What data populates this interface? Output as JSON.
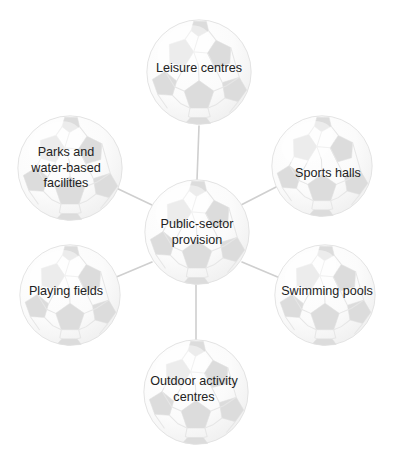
{
  "diagram": {
    "type": "hub-and-spoke",
    "shape_motif": "football",
    "colors": {
      "background": "#ffffff",
      "ball_base": "#fbfbfb",
      "ball_patch": "#dcdcdc",
      "ball_seam": "#e4e4e4",
      "ball_outline": "#e0e0e0",
      "connector": "#cfcfcf",
      "text": "#222222"
    },
    "center": {
      "id": "public-sector-provision",
      "label": "Public-sector provision",
      "lines": [
        "Public-sector",
        "provision"
      ],
      "cx": 197,
      "cy": 232,
      "r": 53
    },
    "nodes": [
      {
        "id": "leisure-centres",
        "label": "Leisure centres",
        "lines": [
          "Leisure centres"
        ],
        "cx": 199,
        "cy": 72,
        "r": 53,
        "label_x": 199,
        "label_y": 69
      },
      {
        "id": "sports-halls",
        "label": "Sports halls",
        "lines": [
          "Sports halls"
        ],
        "cx": 322,
        "cy": 166,
        "r": 51,
        "label_x": 328,
        "label_y": 174
      },
      {
        "id": "swimming-pools",
        "label": "Swimming pools",
        "lines": [
          "Swimming pools"
        ],
        "cx": 325,
        "cy": 295,
        "r": 51,
        "label_x": 327,
        "label_y": 292
      },
      {
        "id": "outdoor-activity-centres",
        "label": "Outdoor activity centres",
        "lines": [
          "Outdoor activity",
          "centres"
        ],
        "cx": 196,
        "cy": 392,
        "r": 53,
        "label_x": 194,
        "label_y": 389
      },
      {
        "id": "playing-fields",
        "label": "Playing fields",
        "lines": [
          "Playing fields"
        ],
        "cx": 70,
        "cy": 295,
        "r": 51,
        "label_x": 66,
        "label_y": 292
      },
      {
        "id": "parks-and-water-based-facilities",
        "label": "Parks and water-based facilities",
        "lines": [
          "Parks and",
          "water-based",
          "facilities"
        ],
        "cx": 70,
        "cy": 168,
        "r": 53,
        "label_x": 66,
        "label_y": 168
      }
    ],
    "connectors": [
      {
        "id": "center-to-leisure-centres",
        "from": "public-sector-provision",
        "to": "leisure-centres",
        "x1": 197,
        "y1": 180,
        "x2": 199,
        "y2": 126
      },
      {
        "id": "center-to-sports-halls",
        "from": "public-sector-provision",
        "to": "sports-halls",
        "x1": 241,
        "y1": 205,
        "x2": 280,
        "y2": 185
      },
      {
        "id": "center-to-swimming-pools",
        "from": "public-sector-provision",
        "to": "swimming-pools",
        "x1": 242,
        "y1": 262,
        "x2": 280,
        "y2": 278
      },
      {
        "id": "center-to-outdoor-activity-centres",
        "from": "public-sector-provision",
        "to": "outdoor-activity-centres",
        "x1": 196,
        "y1": 285,
        "x2": 196,
        "y2": 340
      },
      {
        "id": "center-to-playing-fields",
        "from": "public-sector-provision",
        "to": "playing-fields",
        "x1": 152,
        "y1": 262,
        "x2": 114,
        "y2": 278
      },
      {
        "id": "center-to-parks-and-water-based-facilities",
        "from": "public-sector-provision",
        "to": "parks-and-water-based-facilities",
        "x1": 152,
        "y1": 205,
        "x2": 112,
        "y2": 186
      }
    ]
  }
}
